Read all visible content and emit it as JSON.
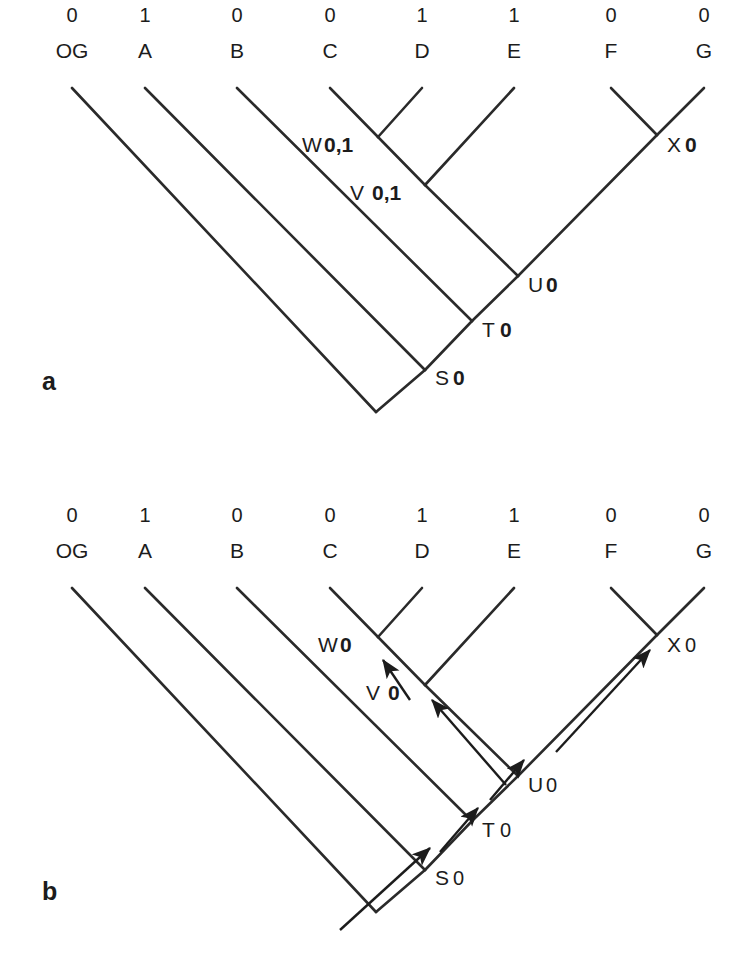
{
  "figure": {
    "type": "phylogenetic-tree-diagram",
    "background": "#ffffff",
    "line_color": "#2a2a2a",
    "text_color": "#1c1c1c",
    "width": 745,
    "height": 960
  },
  "panels": [
    {
      "id": "a",
      "label": "a",
      "label_pos": {
        "x": 42,
        "y": 390
      },
      "y_offset": 0,
      "caption_note": "downpass state sets",
      "tips": [
        {
          "name": "OG",
          "state": "0",
          "x": 72
        },
        {
          "name": "A",
          "state": "1",
          "x": 145
        },
        {
          "name": "B",
          "state": "0",
          "x": 237
        },
        {
          "name": "C",
          "state": "0",
          "x": 330
        },
        {
          "name": "D",
          "state": "1",
          "x": 422
        },
        {
          "name": "E",
          "state": "1",
          "x": 514
        },
        {
          "name": "F",
          "state": "0",
          "x": 611
        },
        {
          "name": "G",
          "state": "0",
          "x": 704
        }
      ],
      "internal_nodes": [
        {
          "id": "W",
          "letter": "W",
          "value": "0,1",
          "value_style": "bold",
          "x": 378,
          "y": 137,
          "label_x": 302,
          "label_y": 152
        },
        {
          "id": "V",
          "letter": "V",
          "value": "0,1",
          "value_style": "bold",
          "x": 425,
          "y": 185,
          "label_x": 350,
          "label_y": 200
        },
        {
          "id": "X",
          "letter": "X",
          "value": "0",
          "value_style": "bold",
          "x": 657,
          "y": 135,
          "label_x": 667,
          "label_y": 152
        },
        {
          "id": "U",
          "letter": "U",
          "value": "0",
          "value_style": "bold",
          "x": 518,
          "y": 276,
          "label_x": 528,
          "label_y": 292
        },
        {
          "id": "T",
          "letter": "T",
          "value": "0",
          "value_style": "bold",
          "x": 472,
          "y": 321,
          "label_x": 482,
          "label_y": 337
        },
        {
          "id": "S",
          "letter": "S",
          "value": "0",
          "value_style": "bold",
          "x": 425,
          "y": 370,
          "label_x": 435,
          "label_y": 385
        }
      ],
      "root": {
        "x": 376,
        "y": 412
      },
      "arrows": []
    },
    {
      "id": "b",
      "label": "b",
      "label_pos": {
        "x": 42,
        "y": 900
      },
      "y_offset": 500,
      "caption_note": "uppass final state assignments with optimization arrows",
      "tips": [
        {
          "name": "OG",
          "state": "0",
          "x": 72
        },
        {
          "name": "A",
          "state": "1",
          "x": 145
        },
        {
          "name": "B",
          "state": "0",
          "x": 237
        },
        {
          "name": "C",
          "state": "0",
          "x": 330
        },
        {
          "name": "D",
          "state": "1",
          "x": 422
        },
        {
          "name": "E",
          "state": "1",
          "x": 514
        },
        {
          "name": "F",
          "state": "0",
          "x": 611
        },
        {
          "name": "G",
          "state": "0",
          "x": 704
        }
      ],
      "internal_nodes": [
        {
          "id": "W",
          "letter": "W",
          "value": "0",
          "value_style": "bold",
          "x": 378,
          "y": 637,
          "label_x": 318,
          "label_y": 652
        },
        {
          "id": "V",
          "letter": "V",
          "value": "0",
          "value_style": "bold",
          "x": 425,
          "y": 685,
          "label_x": 366,
          "label_y": 700
        },
        {
          "id": "X",
          "letter": "X",
          "value": "0",
          "value_style": "plain",
          "x": 657,
          "y": 635,
          "label_x": 667,
          "label_y": 652
        },
        {
          "id": "U",
          "letter": "U",
          "value": "0",
          "value_style": "plain",
          "x": 518,
          "y": 776,
          "label_x": 528,
          "label_y": 792
        },
        {
          "id": "T",
          "letter": "T",
          "value": "0",
          "value_style": "plain",
          "x": 472,
          "y": 821,
          "label_x": 482,
          "label_y": 837
        },
        {
          "id": "S",
          "letter": "S",
          "value": "0",
          "value_style": "plain",
          "x": 425,
          "y": 870,
          "label_x": 435,
          "label_y": 885
        }
      ],
      "root": {
        "x": 376,
        "y": 912
      },
      "arrows": [
        {
          "from": "V",
          "to": "W",
          "x1": 410,
          "y1": 700,
          "x2": 383,
          "y2": 660
        },
        {
          "from": "U",
          "to": "V",
          "x1": 506,
          "y1": 785,
          "x2": 432,
          "y2": 700
        },
        {
          "from": "U",
          "to": "X",
          "x1": 556,
          "y1": 752,
          "x2": 650,
          "y2": 650
        },
        {
          "from": "T",
          "to": "U",
          "x1": 490,
          "y1": 800,
          "x2": 524,
          "y2": 760
        },
        {
          "from": "S",
          "to": "T",
          "x1": 440,
          "y1": 852,
          "x2": 478,
          "y2": 808
        },
        {
          "from": "root",
          "to": "S",
          "x1": 340,
          "y1": 930,
          "x2": 430,
          "y2": 848
        }
      ]
    }
  ],
  "geometry": {
    "tip_state_y": 22,
    "tip_name_y": 58,
    "branch_top_y": 88,
    "branch_slope": 1,
    "note": "tips descend at 45 degrees; left-group tips slope down-right, right-group tips slope down-left"
  }
}
